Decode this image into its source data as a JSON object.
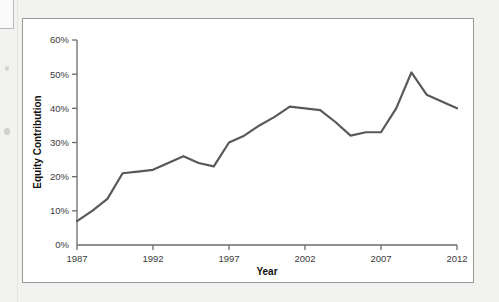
{
  "figure": {
    "background_color": "#ffffff",
    "frame_color": "#9a9a98",
    "page_color": "#f2f2f0"
  },
  "chart_data": {
    "type": "line",
    "title": "",
    "xlabel": "Year",
    "ylabel": "Equity Contribution",
    "xlim": [
      1987,
      2012
    ],
    "ylim": [
      0,
      60
    ],
    "grid": false,
    "legend": null,
    "y_tick_labels": [
      "0%",
      "10%",
      "20%",
      "30%",
      "40%",
      "50%",
      "60%"
    ],
    "y_tick_values": [
      0,
      10,
      20,
      30,
      40,
      50,
      60
    ],
    "x_tick_labels": [
      "1987",
      "1992",
      "1997",
      "2002",
      "2007",
      "2012"
    ],
    "x_tick_values": [
      1987,
      1992,
      1997,
      2002,
      2007,
      2012
    ],
    "series": [
      {
        "name": "Equity Contribution",
        "color": "#595959",
        "line_width": 2.2,
        "x": [
          1987,
          1988,
          1989,
          1990,
          1991,
          1992,
          1993,
          1994,
          1995,
          1996,
          1997,
          1998,
          1999,
          2000,
          2001,
          2002,
          2003,
          2004,
          2005,
          2006,
          2007,
          2008,
          2009,
          2010,
          2011,
          2012
        ],
        "values": [
          7,
          10,
          13.5,
          21,
          21.5,
          22,
          24,
          26,
          24,
          23,
          30,
          32,
          35,
          37.5,
          40.5,
          40,
          39.5,
          36,
          32,
          33,
          33,
          40,
          50.5,
          44,
          42,
          40
        ]
      }
    ]
  },
  "axis_titles": {
    "x": "Year",
    "y": "Equity Contribution"
  }
}
